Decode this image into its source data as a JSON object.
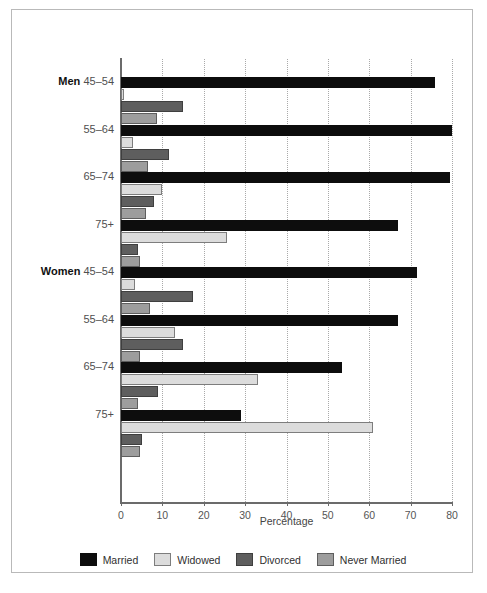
{
  "chart_data": {
    "type": "bar",
    "orientation": "horizontal",
    "title": "",
    "xlabel": "Percentage",
    "ylabel": "",
    "xlim": [
      0,
      80
    ],
    "xticks": [
      0,
      10,
      20,
      30,
      40,
      50,
      60,
      70,
      80
    ],
    "grid": "vertical-dotted",
    "legend_position": "bottom-center",
    "legend": [
      "Married",
      "Widowed",
      "Divorced",
      "Never Married"
    ],
    "series": [
      {
        "name": "Married",
        "color": "#0d0d0d",
        "values": [
          76.0,
          80.0,
          79.5,
          67.0,
          71.5,
          67.0,
          53.5,
          29.0
        ]
      },
      {
        "name": "Widowed",
        "color": "#dcdcdc",
        "values": [
          0.8,
          3.0,
          10.0,
          25.5,
          3.5,
          13.0,
          33.0,
          61.0
        ]
      },
      {
        "name": "Divorced",
        "color": "#5e5e5e",
        "values": [
          15.0,
          11.5,
          8.0,
          4.0,
          17.5,
          15.0,
          9.0,
          5.0
        ]
      },
      {
        "name": "Never Married",
        "color": "#9d9d9d",
        "values": [
          8.7,
          6.5,
          6.0,
          4.5,
          7.0,
          4.5,
          4.0,
          4.5
        ]
      }
    ],
    "groups": [
      {
        "gender": "Men",
        "age": "45–54",
        "bars": [
          {
            "label": "Married",
            "value": 76.0
          },
          {
            "label": "Widowed",
            "value": 0.8
          },
          {
            "label": "Divorced",
            "value": 15.0
          },
          {
            "label": "Never Married",
            "value": 8.7
          }
        ]
      },
      {
        "gender": "",
        "age": "55–64",
        "bars": [
          {
            "label": "Married",
            "value": 80.0
          },
          {
            "label": "Widowed",
            "value": 3.0
          },
          {
            "label": "Divorced",
            "value": 11.5
          },
          {
            "label": "Never Married",
            "value": 6.5
          }
        ]
      },
      {
        "gender": "",
        "age": "65–74",
        "bars": [
          {
            "label": "Married",
            "value": 79.5
          },
          {
            "label": "Widowed",
            "value": 10.0
          },
          {
            "label": "Divorced",
            "value": 8.0
          },
          {
            "label": "Never Married",
            "value": 6.0
          }
        ]
      },
      {
        "gender": "",
        "age": "75+",
        "bars": [
          {
            "label": "Married",
            "value": 67.0
          },
          {
            "label": "Widowed",
            "value": 25.5
          },
          {
            "label": "Divorced",
            "value": 4.0
          },
          {
            "label": "Never Married",
            "value": 4.5
          }
        ]
      },
      {
        "gender": "Women",
        "age": "45–54",
        "bars": [
          {
            "label": "Married",
            "value": 71.5
          },
          {
            "label": "Widowed",
            "value": 3.5
          },
          {
            "label": "Divorced",
            "value": 17.5
          },
          {
            "label": "Never Married",
            "value": 7.0
          }
        ]
      },
      {
        "gender": "",
        "age": "55–64",
        "bars": [
          {
            "label": "Married",
            "value": 67.0
          },
          {
            "label": "Widowed",
            "value": 13.0
          },
          {
            "label": "Divorced",
            "value": 15.0
          },
          {
            "label": "Never Married",
            "value": 4.5
          }
        ]
      },
      {
        "gender": "",
        "age": "65–74",
        "bars": [
          {
            "label": "Married",
            "value": 53.5
          },
          {
            "label": "Widowed",
            "value": 33.0
          },
          {
            "label": "Divorced",
            "value": 9.0
          },
          {
            "label": "Never Married",
            "value": 4.0
          }
        ]
      },
      {
        "gender": "",
        "age": "75+",
        "bars": [
          {
            "label": "Married",
            "value": 29.0
          },
          {
            "label": "Widowed",
            "value": 61.0
          },
          {
            "label": "Divorced",
            "value": 5.0
          },
          {
            "label": "Never Married",
            "value": 4.5
          }
        ]
      }
    ]
  },
  "footer": {
    "note": ""
  }
}
